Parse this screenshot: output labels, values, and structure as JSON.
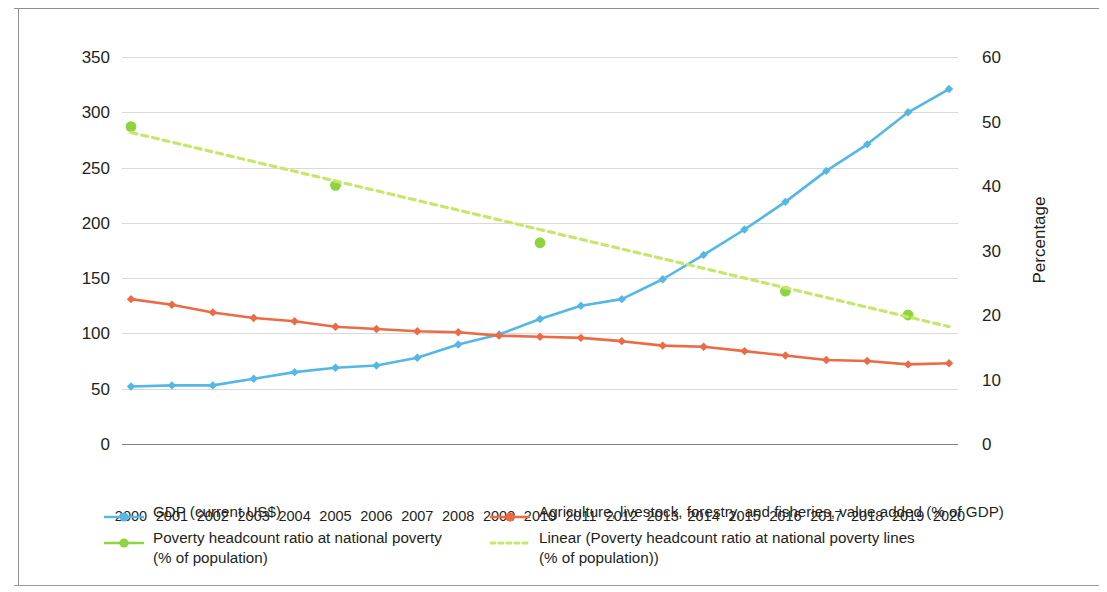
{
  "chart_data": {
    "type": "line",
    "title": "",
    "xlabel": "",
    "ylabel": "US$ billions",
    "y2label": "Percentage",
    "grid": true,
    "legend_position": "bottom",
    "x": [
      2000,
      2001,
      2002,
      2003,
      2004,
      2005,
      2006,
      2007,
      2008,
      2009,
      2010,
      2011,
      2012,
      2013,
      2014,
      2015,
      2016,
      2017,
      2018,
      2019,
      2020
    ],
    "ylim": [
      0,
      350
    ],
    "yticks": [
      0,
      50,
      100,
      150,
      200,
      250,
      300,
      350
    ],
    "y2lim": [
      0,
      60
    ],
    "y2ticks": [
      0,
      10,
      20,
      30,
      40,
      50,
      60
    ],
    "series": [
      {
        "name": "GDP (current US$)",
        "axis": "left",
        "color": "#55B7E6",
        "style": "solid",
        "marker": "diamond",
        "values": [
          52,
          53,
          53,
          59,
          65,
          69,
          71,
          78,
          90,
          99,
          113,
          125,
          131,
          149,
          171,
          194,
          219,
          247,
          271,
          300,
          321
        ]
      },
      {
        "name": "Agriculture, livestock, forestry, and fisheries, value added (% of GDP)",
        "axis": "left",
        "color": "#EC6A45",
        "style": "solid",
        "marker": "diamond",
        "values": [
          131,
          126,
          119,
          114,
          111,
          106,
          104,
          102,
          101,
          98,
          97,
          96,
          93,
          89,
          88,
          84,
          80,
          76,
          75,
          72,
          73
        ]
      },
      {
        "name": "Poverty headcount ratio at national poverty (% of population)",
        "axis": "right",
        "color": "#8DD43F",
        "style": "marker-only",
        "marker": "circle",
        "points": [
          {
            "x": 2000,
            "y": 49.2
          },
          {
            "x": 2005,
            "y": 40.1
          },
          {
            "x": 2010,
            "y": 31.2
          },
          {
            "x": 2016,
            "y": 23.7
          },
          {
            "x": 2019,
            "y": 20.0
          }
        ]
      },
      {
        "name": "Linear (Poverty headcount ratio at national poverty lines (% of population))",
        "axis": "right",
        "color": "#C5E86C",
        "style": "dashed",
        "marker": "none",
        "trend_from": {
          "x": 2000,
          "y": 48.3
        },
        "trend_to": {
          "x": 2020,
          "y": 18.2
        }
      }
    ]
  },
  "axes": {
    "left": {
      "title": "US$ billions",
      "ticks": [
        "350",
        "300",
        "250",
        "200",
        "150",
        "100",
        "50",
        "0"
      ]
    },
    "right": {
      "title": "Percentage",
      "ticks": [
        "60",
        "50",
        "40",
        "30",
        "20",
        "10",
        "0"
      ]
    },
    "bottom": {
      "ticks": [
        "2000",
        "2001",
        "2002",
        "2003",
        "2004",
        "2005",
        "2006",
        "2007",
        "2008",
        "2009",
        "2010",
        "2011",
        "2012",
        "2013",
        "2014",
        "2015",
        "2016",
        "2017",
        "2018",
        "2019",
        "2020"
      ]
    }
  },
  "legend": {
    "items": [
      {
        "label": "GDP (current US$)",
        "color": "#55B7E6",
        "style": "solid",
        "marker": "circle"
      },
      {
        "label": "Agriculture, livestock, forestry, and fisheries, value added (% of GDP)",
        "color": "#EC6A45",
        "style": "solid",
        "marker": "circle"
      },
      {
        "label": "Poverty headcount ratio at national poverty\n(% of population)",
        "color": "#8DD43F",
        "style": "solid",
        "marker": "circle"
      },
      {
        "label": "Linear (Poverty headcount ratio at national poverty lines\n(% of population))",
        "color": "#C5E86C",
        "style": "dashed",
        "marker": "none"
      }
    ]
  }
}
